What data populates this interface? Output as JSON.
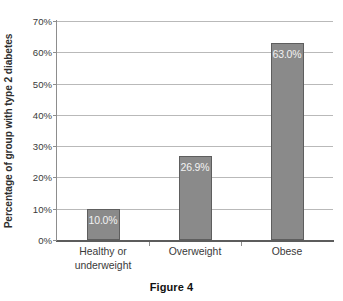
{
  "caption": "Figure 4",
  "chart_data": {
    "type": "bar",
    "title": "",
    "xlabel": "",
    "ylabel": "Percentage of group with type 2 diabetes",
    "categories": [
      "Healthy or underweight",
      "Overweight",
      "Obese"
    ],
    "category_lines": [
      [
        "Healthy or",
        "underweight"
      ],
      [
        "Overweight"
      ],
      [
        "Obese"
      ]
    ],
    "values": [
      10.0,
      26.9,
      63.0
    ],
    "data_labels": [
      "10.0%",
      "26.9%",
      "63.0%"
    ],
    "ylim": [
      0,
      70
    ],
    "ytick_values": [
      0,
      10,
      20,
      30,
      40,
      50,
      60,
      70
    ],
    "ytick_labels": [
      "0%",
      "10%",
      "20%",
      "30%",
      "40%",
      "50%",
      "60%",
      "70%"
    ],
    "grid": true,
    "grid_axis": "y",
    "legend": false,
    "legend_position": "none",
    "bar_fill_color": "#8a8a8a",
    "bar_border_color": "#5e5e5e",
    "gridline_color": "#b9b9b9",
    "axis_color": "#5c5c5c",
    "text_color": "#3a3a3a",
    "data_label_color": "#f2f2f2",
    "background_color": "#ffffff"
  }
}
